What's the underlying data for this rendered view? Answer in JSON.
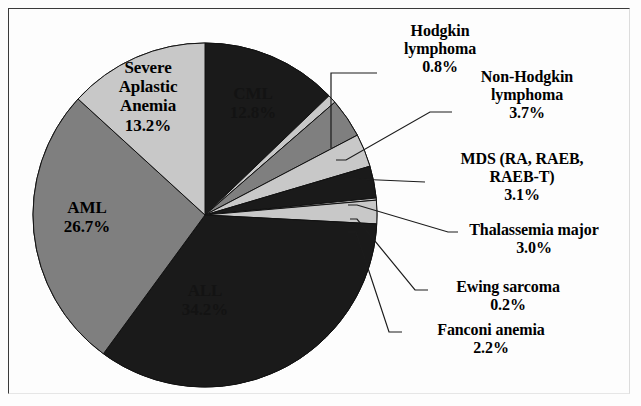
{
  "figure": {
    "background": "#fdfdfd",
    "border_color": "#3a3a3a"
  },
  "chart_data": {
    "type": "pie",
    "title": "",
    "subtitle": "",
    "xlabel": "",
    "ylabel": "",
    "legend_position": "none",
    "grid": false,
    "units": "percent",
    "total": 100.0,
    "start_angle_deg": 0,
    "direction": "clockwise",
    "categories": [
      "CML",
      "Hodgkin lymphoma",
      "Non-Hodgkin lymphoma",
      "MDS (RA, RAEB, RAEB-T)",
      "Thalassemia major",
      "Ewing sarcoma",
      "Fanconi anemia",
      "ALL",
      "AML",
      "Severe Aplastic Anemia"
    ],
    "values": [
      12.8,
      0.8,
      3.7,
      3.1,
      3.0,
      0.2,
      2.2,
      34.2,
      26.7,
      13.2
    ],
    "value_labels": [
      "12.8%",
      "0.8%",
      "3.7%",
      "3.1%",
      "3.0%",
      "0.2%",
      "2.2%",
      "34.2%",
      "26.7%",
      "13.2%"
    ],
    "colors": [
      "#1a1a1a",
      "#c8c8c8",
      "#7f7f7f",
      "#c8c8c8",
      "#1a1a1a",
      "#c8c8c8",
      "#c8c8c8",
      "#1a1a1a",
      "#7f7f7f",
      "#c8c8c8"
    ],
    "slices": [
      {
        "name": "CML",
        "value": 12.8,
        "value_label": "12.8%",
        "color": "#1a1a1a",
        "label_placement": "inside",
        "name_lines": [
          "CML"
        ]
      },
      {
        "name": "Hodgkin lymphoma",
        "value": 0.8,
        "value_label": "0.8%",
        "color": "#c8c8c8",
        "label_placement": "outside",
        "name_lines": [
          "Hodgkin",
          "lymphoma"
        ]
      },
      {
        "name": "Non-Hodgkin lymphoma",
        "value": 3.7,
        "value_label": "3.7%",
        "color": "#7f7f7f",
        "label_placement": "outside",
        "name_lines": [
          "Non-Hodgkin",
          "lymphoma"
        ]
      },
      {
        "name": "MDS (RA, RAEB, RAEB-T)",
        "value": 3.1,
        "value_label": "3.1%",
        "color": "#c8c8c8",
        "label_placement": "outside",
        "name_lines": [
          "MDS (RA, RAEB,",
          "RAEB-T)"
        ]
      },
      {
        "name": "Thalassemia major",
        "value": 3.0,
        "value_label": "3.0%",
        "color": "#1a1a1a",
        "label_placement": "outside",
        "name_lines": [
          "Thalassemia major"
        ]
      },
      {
        "name": "Ewing sarcoma",
        "value": 0.2,
        "value_label": "0.2%",
        "color": "#c8c8c8",
        "label_placement": "outside",
        "name_lines": [
          "Ewing sarcoma"
        ]
      },
      {
        "name": "Fanconi anemia",
        "value": 2.2,
        "value_label": "2.2%",
        "color": "#c8c8c8",
        "label_placement": "outside",
        "name_lines": [
          "Fanconi anemia"
        ]
      },
      {
        "name": "ALL",
        "value": 34.2,
        "value_label": "34.2%",
        "color": "#1a1a1a",
        "label_placement": "inside",
        "name_lines": [
          "ALL"
        ]
      },
      {
        "name": "AML",
        "value": 26.7,
        "value_label": "26.7%",
        "color": "#7f7f7f",
        "label_placement": "inside",
        "name_lines": [
          "AML"
        ]
      },
      {
        "name": "Severe Aplastic Anemia",
        "value": 13.2,
        "value_label": "13.2%",
        "color": "#c8c8c8",
        "label_placement": "inside",
        "name_lines": [
          "Severe",
          "Aplastic",
          "Anemia"
        ]
      }
    ]
  },
  "labels": {
    "cml": "CML\n12.8%",
    "sev": "Severe\nAplastic\nAnemia\n13.2%",
    "aml": "AML\n26.7%",
    "all": "ALL\n34.2%",
    "hl": "Hodgkin\nlymphoma\n0.8%",
    "nhl": "Non-Hodgkin\nlymphoma\n3.7%",
    "mds": "MDS (RA, RAEB,\nRAEB-T)\n3.1%",
    "thal": "Thalassemia major\n3.0%",
    "ewing": "Ewing sarcoma\n0.2%",
    "fanc": "Fanconi anemia\n2.2%"
  }
}
